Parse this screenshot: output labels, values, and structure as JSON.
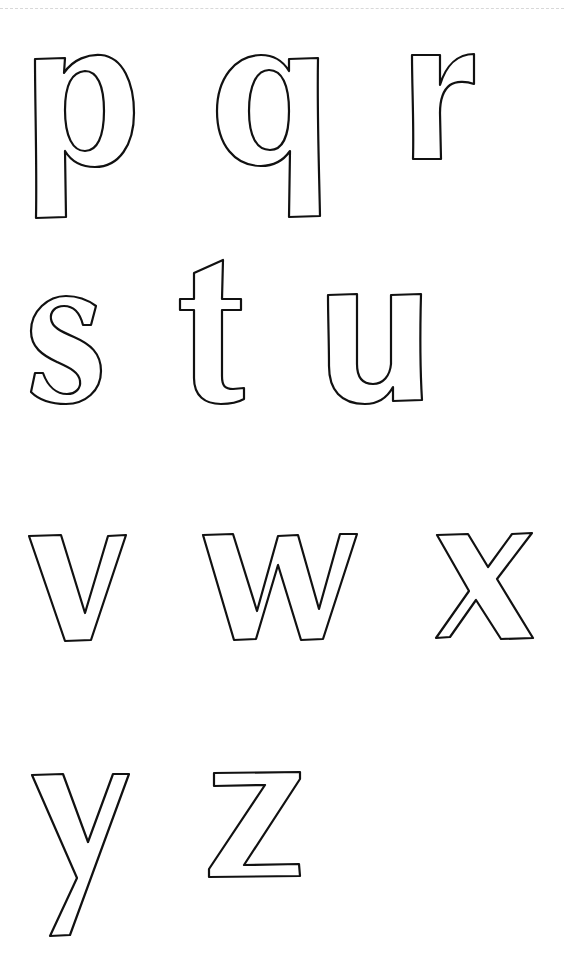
{
  "worksheet": {
    "title": "Lowercase letters p–z outline",
    "stroke_color": "#111111",
    "background": "#ffffff",
    "rows": [
      {
        "letters": [
          "p",
          "q",
          "r"
        ]
      },
      {
        "letters": [
          "s",
          "t",
          "u"
        ]
      },
      {
        "letters": [
          "v",
          "w",
          "x"
        ]
      },
      {
        "letters": [
          "y",
          "z"
        ]
      }
    ],
    "letters": [
      {
        "char": "p",
        "x": 33,
        "y": 55,
        "w": 100,
        "h": 165
      },
      {
        "char": "q",
        "x": 217,
        "y": 55,
        "w": 104,
        "h": 165
      },
      {
        "char": "r",
        "x": 410,
        "y": 53,
        "w": 66,
        "h": 108
      },
      {
        "char": "s",
        "x": 30,
        "y": 295,
        "w": 72,
        "h": 110
      },
      {
        "char": "t",
        "x": 179,
        "y": 258,
        "w": 66,
        "h": 146
      },
      {
        "char": "u",
        "x": 327,
        "y": 292,
        "w": 96,
        "h": 113
      },
      {
        "char": "v",
        "x": 28,
        "y": 534,
        "w": 100,
        "h": 108
      },
      {
        "char": "w",
        "x": 202,
        "y": 533,
        "w": 156,
        "h": 108
      },
      {
        "char": "x",
        "x": 435,
        "y": 532,
        "w": 100,
        "h": 108
      },
      {
        "char": "y",
        "x": 31,
        "y": 772,
        "w": 99,
        "h": 166
      },
      {
        "char": "z",
        "x": 208,
        "y": 771,
        "w": 94,
        "h": 108
      }
    ]
  }
}
